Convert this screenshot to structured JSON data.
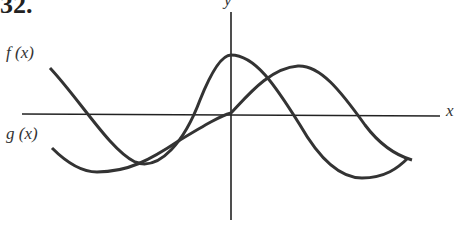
{
  "problem_number": "32.",
  "labels": {
    "f": "f (x)",
    "g": "g (x)",
    "x_axis": "x",
    "y_axis": "y"
  },
  "curves": [
    {
      "name": "f(x)",
      "shape": "cosine-like",
      "description": "maximum at y-axis, crosses x-axis on both sides"
    },
    {
      "name": "g(x)",
      "shape": "sine-like",
      "description": "passes through origin, maximum right of y-axis"
    }
  ],
  "colors": {
    "curve": "#333333",
    "axis": "#222222"
  }
}
